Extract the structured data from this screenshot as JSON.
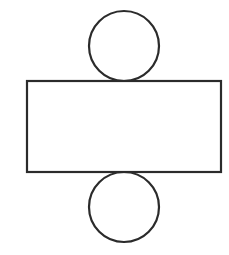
{
  "diagram": {
    "title": "",
    "stroke_color": "#2b2b2b",
    "background": "#ffffff",
    "stroke_width": 2.2,
    "shapes": {
      "top_circle": {
        "cx": 124,
        "cy": 46,
        "r": 35
      },
      "rectangle": {
        "x": 27,
        "y": 81,
        "width": 194,
        "height": 91
      },
      "bottom_circle": {
        "cx": 124,
        "cy": 207,
        "r": 35
      }
    }
  }
}
